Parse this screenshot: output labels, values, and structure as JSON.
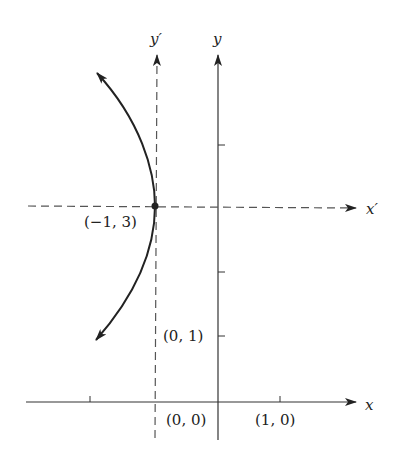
{
  "diagram": {
    "type": "translated-axes-parabola",
    "axes": {
      "x": {
        "label": "x"
      },
      "y": {
        "label": "y"
      },
      "x_prime": {
        "label": "x′"
      },
      "y_prime": {
        "label": "y′"
      }
    },
    "points": {
      "vertex": {
        "label": "(−1, 3)",
        "x": -1,
        "y": 3
      },
      "origin": {
        "label": "(0, 0)"
      },
      "y_one": {
        "label": "(0, 1)"
      },
      "x_one": {
        "label": "(1, 0)"
      }
    },
    "curve": {
      "description": "parabola opening left with vertex at (−1, 3)"
    },
    "colors": {
      "ink": "#222222",
      "dashed": "#555555",
      "background": "#ffffff"
    }
  }
}
